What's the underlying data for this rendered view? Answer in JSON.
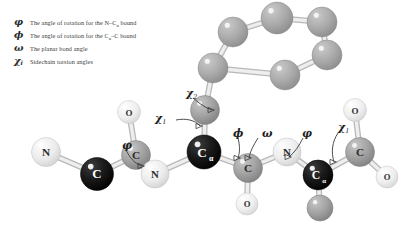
{
  "legend": {
    "rows": [
      {
        "symbol": "φ",
        "sub": "",
        "text_pre": "The angle of rotation  for the N–C",
        "text_sub": "α",
        "text_post": " bound"
      },
      {
        "symbol": "ϕ",
        "sub": "",
        "text_pre": "The angle of rotation  for the C",
        "text_sub": "α",
        "text_post": "–C bound"
      },
      {
        "symbol": "ω",
        "sub": "",
        "text_pre": "The planar bond angle",
        "text_sub": "",
        "text_post": ""
      },
      {
        "symbol": "χ",
        "sub": "i",
        "text_pre": "Sidechain torsion angles",
        "text_sub": "",
        "text_post": ""
      }
    ]
  },
  "annotations": [
    {
      "name": "chi2-label",
      "symbol": "χ",
      "sub": "2",
      "x": 186,
      "y": 88
    },
    {
      "name": "chi1-label-left",
      "symbol": "χ",
      "sub": "1",
      "x": 155,
      "y": 113
    },
    {
      "name": "phi-label-left",
      "symbol": "φ",
      "sub": "",
      "x": 122,
      "y": 140
    },
    {
      "name": "psi-label-center",
      "symbol": "ϕ",
      "sub": "",
      "x": 233,
      "y": 128
    },
    {
      "name": "omega-label",
      "symbol": "ω",
      "sub": "",
      "x": 262,
      "y": 128
    },
    {
      "name": "phi-label-right",
      "symbol": "φ",
      "sub": "",
      "x": 302,
      "y": 128
    },
    {
      "name": "chi1-label-right",
      "symbol": "χ",
      "sub": "1",
      "x": 338,
      "y": 122
    }
  ],
  "colors": {
    "nitrogen": "#e8e8e8",
    "oxygen": "#ebebeb",
    "carbon": "#9e9e9e",
    "alpha_carbon": "#1a1a1a",
    "ring_carbon": "#a8a8a8",
    "bond": "#cfcfcf",
    "label_dark": "#1d1d1d",
    "text": "#3a3a3a"
  },
  "atoms": [
    {
      "name": "atom-n-left",
      "label": "N",
      "x": 46,
      "y": 152,
      "r": 14.5,
      "kind": "n"
    },
    {
      "name": "atom-ca-left",
      "label": "C",
      "x": 97,
      "y": 174,
      "r": 16.5,
      "kind": "ca"
    },
    {
      "name": "atom-c-left",
      "label": "C",
      "x": 136,
      "y": 155,
      "r": 14.5,
      "kind": "c"
    },
    {
      "name": "atom-o-left",
      "label": "O",
      "x": 129,
      "y": 112,
      "r": 11.5,
      "kind": "o"
    },
    {
      "name": "atom-n-center",
      "label": "N",
      "x": 155,
      "y": 174,
      "r": 14,
      "kind": "n"
    },
    {
      "name": "atom-ca-center",
      "label": "C",
      "sub": "α",
      "x": 204,
      "y": 152,
      "r": 17,
      "kind": "ca"
    },
    {
      "name": "atom-cb-center",
      "label": "",
      "x": 205,
      "y": 110,
      "r": 14.5,
      "kind": "c"
    },
    {
      "name": "atom-c-center",
      "label": "C",
      "x": 248,
      "y": 168,
      "r": 14.5,
      "kind": "c"
    },
    {
      "name": "atom-o-center",
      "label": "O",
      "x": 247,
      "y": 204,
      "r": 11,
      "kind": "o"
    },
    {
      "name": "atom-n-right",
      "label": "N",
      "x": 287,
      "y": 152,
      "r": 14,
      "kind": "n"
    },
    {
      "name": "atom-ca-right",
      "label": "C",
      "sub": "α",
      "x": 318,
      "y": 175,
      "r": 15,
      "kind": "ca"
    },
    {
      "name": "atom-cb-right",
      "label": "",
      "x": 320,
      "y": 208,
      "r": 13,
      "kind": "c"
    },
    {
      "name": "atom-c-right",
      "label": "C",
      "x": 360,
      "y": 152,
      "r": 14.5,
      "kind": "c"
    },
    {
      "name": "atom-o-right-top",
      "label": "O",
      "x": 355,
      "y": 110,
      "r": 11.5,
      "kind": "o"
    },
    {
      "name": "atom-o-right-low",
      "label": "O",
      "x": 387,
      "y": 177,
      "r": 11,
      "kind": "o"
    },
    {
      "name": "ring-c1",
      "label": "",
      "x": 213,
      "y": 68,
      "r": 15,
      "kind": "ring"
    },
    {
      "name": "ring-c2",
      "label": "",
      "x": 233,
      "y": 32,
      "r": 15,
      "kind": "ring"
    },
    {
      "name": "ring-c3",
      "label": "",
      "x": 277,
      "y": 18,
      "r": 16,
      "kind": "ring"
    },
    {
      "name": "ring-c4",
      "label": "",
      "x": 322,
      "y": 22,
      "r": 15,
      "kind": "ring"
    },
    {
      "name": "ring-c5",
      "label": "",
      "x": 327,
      "y": 55,
      "r": 15,
      "kind": "ring"
    },
    {
      "name": "ring-c6",
      "label": "",
      "x": 285,
      "y": 75,
      "r": 15,
      "kind": "ring"
    }
  ],
  "bonds": [
    {
      "name": "bond-n-ca-left",
      "x1": 46,
      "y1": 152,
      "x2": 97,
      "y2": 174
    },
    {
      "name": "bond-ca-c-left",
      "x1": 97,
      "y1": 174,
      "x2": 136,
      "y2": 155
    },
    {
      "name": "bond-c-o-left",
      "x1": 136,
      "y1": 155,
      "x2": 129,
      "y2": 112
    },
    {
      "name": "bond-c-n-center",
      "x1": 136,
      "y1": 155,
      "x2": 155,
      "y2": 174
    },
    {
      "name": "bond-n-ca-center",
      "x1": 155,
      "y1": 174,
      "x2": 204,
      "y2": 152
    },
    {
      "name": "bond-ca-cb-center",
      "x1": 204,
      "y1": 152,
      "x2": 205,
      "y2": 110
    },
    {
      "name": "bond-ca-c-center",
      "x1": 204,
      "y1": 152,
      "x2": 248,
      "y2": 168
    },
    {
      "name": "bond-c-o-center",
      "x1": 248,
      "y1": 168,
      "x2": 247,
      "y2": 204
    },
    {
      "name": "bond-c-n-right",
      "x1": 248,
      "y1": 168,
      "x2": 287,
      "y2": 152
    },
    {
      "name": "bond-n-ca-right",
      "x1": 287,
      "y1": 152,
      "x2": 318,
      "y2": 175
    },
    {
      "name": "bond-ca-cb-right",
      "x1": 318,
      "y1": 175,
      "x2": 320,
      "y2": 208
    },
    {
      "name": "bond-ca-c-right",
      "x1": 318,
      "y1": 175,
      "x2": 360,
      "y2": 152
    },
    {
      "name": "bond-c-o-right-top",
      "x1": 360,
      "y1": 152,
      "x2": 355,
      "y2": 110
    },
    {
      "name": "bond-c-o-right-low",
      "x1": 360,
      "y1": 152,
      "x2": 387,
      "y2": 177
    },
    {
      "name": "bond-cb-ring",
      "x1": 205,
      "y1": 110,
      "x2": 213,
      "y2": 68
    },
    {
      "name": "bond-ring-1-2",
      "x1": 213,
      "y1": 68,
      "x2": 233,
      "y2": 32
    },
    {
      "name": "bond-ring-2-3",
      "x1": 233,
      "y1": 32,
      "x2": 277,
      "y2": 18
    },
    {
      "name": "bond-ring-3-4",
      "x1": 277,
      "y1": 18,
      "x2": 322,
      "y2": 22
    },
    {
      "name": "bond-ring-4-5",
      "x1": 322,
      "y1": 22,
      "x2": 327,
      "y2": 55
    },
    {
      "name": "bond-ring-5-6",
      "x1": 327,
      "y1": 55,
      "x2": 285,
      "y2": 75
    },
    {
      "name": "bond-ring-6-1",
      "x1": 285,
      "y1": 75,
      "x2": 213,
      "y2": 68
    }
  ],
  "arrows": [
    {
      "name": "arrow-chi2",
      "d": "M193,98 C200,104 206,108 212,110"
    },
    {
      "name": "arrow-chi1-left",
      "d": "M176,120 C186,118 195,120 200,126"
    },
    {
      "name": "arrow-phi-left",
      "d": "M126,150 C130,158 134,163 142,166"
    },
    {
      "name": "arrow-psi-center",
      "d": "M238,138 C240,146 240,152 238,158"
    },
    {
      "name": "arrow-omega",
      "d": "M258,138 C253,146 250,152 249,158"
    },
    {
      "name": "arrow-phi-right",
      "d": "M303,138 C299,146 295,152 289,157"
    },
    {
      "name": "arrow-chi1-right",
      "d": "M338,133 C332,142 331,152 334,162"
    }
  ]
}
